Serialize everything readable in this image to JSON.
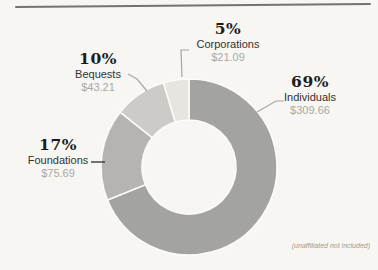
{
  "page": {
    "background_color": "#f7f6f2",
    "rule_color": "#737373"
  },
  "chart_data": {
    "type": "donut",
    "direction": "clockwise",
    "start_angle_deg": 0,
    "center": [
      189,
      167
    ],
    "outer_radius": 88,
    "inner_radius": 47,
    "separator_color": "#fcfbf8",
    "leader_line_color": "#a6a6a6",
    "legend_position": "callout-labels",
    "note": "(unaffiliated not included)",
    "segments": [
      {
        "label": "Individuals",
        "percent": "69%",
        "amount": "$309.66",
        "value": 309.66,
        "color": "#a3a3a2"
      },
      {
        "label": "Foundations",
        "percent": "17%",
        "amount": "$75.69",
        "value": 75.69,
        "color": "#b5b4b2"
      },
      {
        "label": "Bequests",
        "percent": "10%",
        "amount": "$43.21",
        "value": 43.21,
        "color": "#cccbc8"
      },
      {
        "label": "Corporations",
        "percent": "5%",
        "amount": "$21.09",
        "value": 21.09,
        "color": "#e7e5df"
      }
    ]
  }
}
